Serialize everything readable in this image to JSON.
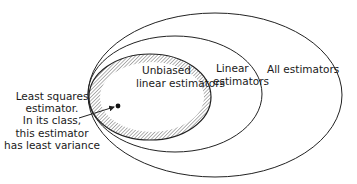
{
  "diagram": {
    "type": "nested-ellipses",
    "sets": [
      {
        "id": "all",
        "label": "All estimators"
      },
      {
        "id": "linear",
        "label_lines": [
          "Linear",
          "estimators"
        ]
      },
      {
        "id": "unbiased-linear",
        "label_lines": [
          "Unbiased",
          "linear estimators"
        ],
        "hatched_border": true
      }
    ],
    "callout": {
      "lines": [
        "Least squares",
        "estimator.",
        "In its class,",
        "this estimator",
        "has least variance"
      ],
      "points_to": "least-squares-point"
    },
    "colors": {
      "stroke": "#222222",
      "hatch": "#9a9a9a",
      "background": "#ffffff"
    }
  }
}
